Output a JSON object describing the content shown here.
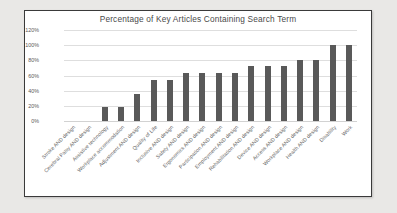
{
  "chart_data": {
    "type": "bar",
    "title": "Percentage of Key Articles Containing Search Term",
    "xlabel": "",
    "ylabel": "",
    "ylim": [
      0,
      120
    ],
    "ytick_labels": [
      "120%",
      "100%",
      "80%",
      "60%",
      "40%",
      "20%",
      "0%"
    ],
    "ytick_values": [
      120,
      100,
      80,
      60,
      40,
      20,
      0
    ],
    "grid": true,
    "legend": "none",
    "bar_color": "#595959",
    "categories": [
      "Stroke AND design",
      "Cerebral Palsy AND design",
      "Assistive technology",
      "Workplace accommodation",
      "Adjustment AND design",
      "Quality of Life",
      "Inclusive AND design",
      "Safety AND design",
      "Ergonomics AND design",
      "Participation AND design",
      "Employment AND design",
      "Rehabilitation AND design",
      "Device AND design",
      "Access AND design",
      "Workplace AND design",
      "Health AND design",
      "Disability",
      "Work"
    ],
    "values": [
      0,
      0,
      18,
      18,
      36,
      54,
      54,
      63,
      63,
      63,
      63,
      72,
      72,
      72,
      81,
      81,
      100,
      100
    ]
  }
}
